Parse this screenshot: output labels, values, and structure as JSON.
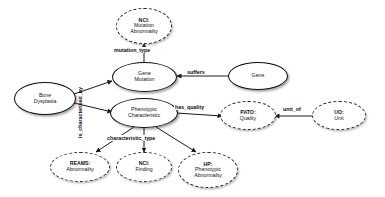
{
  "diagram": {
    "background_color": "#ffffff",
    "node_border_solid_color": "#0d0d0d",
    "node_border_dashed_color": "#2b2b2b",
    "edge_color": "#1a1a1a",
    "text_color": "#111111"
  },
  "nodes": [
    {
      "id": "nci-mutation-abnormality",
      "prefix": "NCI:",
      "lines": [
        "Mutation",
        "Abnormality"
      ],
      "style": "dashed"
    },
    {
      "id": "gene-mutation",
      "prefix": "",
      "lines": [
        "Gene",
        "Mutation"
      ],
      "style": "solid"
    },
    {
      "id": "gene",
      "prefix": "",
      "lines": [
        "Gene"
      ],
      "style": "solid"
    },
    {
      "id": "bone-dysplasia",
      "prefix": "",
      "lines": [
        "Bone",
        "Dysplasia"
      ],
      "style": "solid"
    },
    {
      "id": "phenotypic-characteristic",
      "prefix": "",
      "lines": [
        "Phenotypic",
        "Characteristic"
      ],
      "style": "solid"
    },
    {
      "id": "pato-quality",
      "prefix": "PATO:",
      "lines": [
        "Quality"
      ],
      "style": "dashed"
    },
    {
      "id": "uo-unit",
      "prefix": "UO:",
      "lines": [
        "Unit"
      ],
      "style": "dashed"
    },
    {
      "id": "reams-abnormality",
      "prefix": "REAMS:",
      "lines": [
        "Abnormality"
      ],
      "style": "dashed"
    },
    {
      "id": "nci-finding",
      "prefix": "NCI:",
      "lines": [
        "Finding"
      ],
      "style": "dashed"
    },
    {
      "id": "hp-phenotypic-abnormality",
      "prefix": "HP:",
      "lines": [
        "Phenotypic",
        "Abnormality"
      ],
      "style": "dashed"
    }
  ],
  "edges": [
    {
      "id": "mutation-type",
      "label": "mutation_type",
      "from": "gene-mutation",
      "to": "nci-mutation-abnormality"
    },
    {
      "id": "suffers",
      "label": "suffers",
      "from": "gene",
      "to": "gene-mutation"
    },
    {
      "id": "is-characterised-by",
      "label": "is_characterised_by",
      "from": "bone-dysplasia",
      "to": "gene-mutation"
    },
    {
      "id": "is-characterised-by-2",
      "label": "",
      "from": "bone-dysplasia",
      "to": "phenotypic-characteristic"
    },
    {
      "id": "has-quality",
      "label": "has_quality",
      "from": "phenotypic-characteristic",
      "to": "pato-quality"
    },
    {
      "id": "unit-of",
      "label": "unit_of",
      "from": "uo-unit",
      "to": "pato-quality"
    },
    {
      "id": "characteristic-type",
      "label": "characteristic_type",
      "from": "phenotypic-characteristic",
      "to": "reams-abnormality"
    },
    {
      "id": "characteristic-type-2",
      "label": "",
      "from": "phenotypic-characteristic",
      "to": "nci-finding"
    },
    {
      "id": "characteristic-type-3",
      "label": "",
      "from": "phenotypic-characteristic",
      "to": "hp-phenotypic-abnormality"
    }
  ],
  "labels": {
    "mutation_type": "mutation_type",
    "suffers": "suffers",
    "is_characterised_by": "is_characterised_by",
    "has_quality": "has_quality",
    "unit_of": "unit_of",
    "characteristic_type": "characteristic_type"
  },
  "node_text": {
    "nci_mutation_abnormality": {
      "prefix": "NCI:",
      "l1": "Mutation",
      "l2": "Abnormality"
    },
    "gene_mutation": {
      "l1": "Gene",
      "l2": "Mutation"
    },
    "gene": {
      "l1": "Gene"
    },
    "bone_dysplasia": {
      "l1": "Bone",
      "l2": "Dysplasia"
    },
    "phenotypic_characteristic": {
      "l1": "Phenotypic",
      "l2": "Characteristic"
    },
    "pato_quality": {
      "prefix": "PATO:",
      "l1": "Quality"
    },
    "uo_unit": {
      "prefix": "UO:",
      "l1": "Unit"
    },
    "reams_abnormality": {
      "prefix": "REAMS:",
      "l1": "Abnormality"
    },
    "nci_finding": {
      "prefix": "NCI:",
      "l1": "Finding"
    },
    "hp_phenotypic_abnormality": {
      "prefix": "HP:",
      "l1": "Phenotypic",
      "l2": "Abnormality"
    }
  }
}
